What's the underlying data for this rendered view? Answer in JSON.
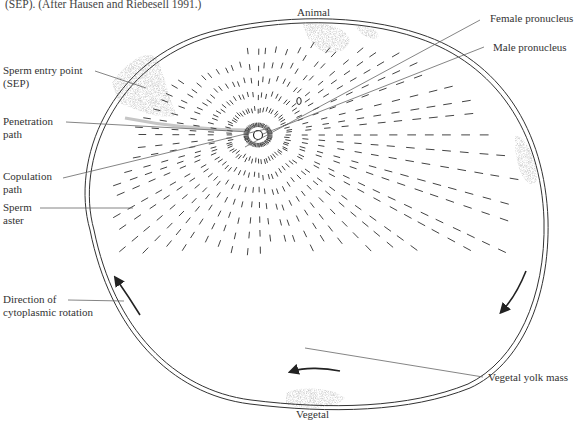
{
  "caption": {
    "line1": "(SEP). (After Hausen and Riebesell 1991.)"
  },
  "poles": {
    "animal": "Animal",
    "vegetal": "Vegetal"
  },
  "labels": {
    "sperm_entry_point_1": "Sperm entry point",
    "sperm_entry_point_2": "(SEP)",
    "penetration_path_1": "Penetration",
    "penetration_path_2": "path",
    "copulation_path_1": "Copulation",
    "copulation_path_2": "path",
    "sperm_aster_1": "Sperm",
    "sperm_aster_2": "aster",
    "rotation_1": "Direction of",
    "rotation_2": "cytoplasmic rotation",
    "female_pronucleus": "Female pronucleus",
    "male_pronucleus": "Male pronucleus",
    "vegetal_yolk_mass": "Vegetal yolk mass"
  },
  "colors": {
    "line": "#444444",
    "stipple": "#9a9a9a",
    "text": "#333333"
  }
}
